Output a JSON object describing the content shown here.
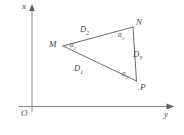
{
  "figure": {
    "type": "geometry-diagram",
    "axes": {
      "x_label": "x",
      "y_label": "y",
      "origin_label": "O",
      "x_axis_direction": "up",
      "y_axis_direction": "right",
      "origin_px": {
        "x": 32,
        "y": 107
      }
    },
    "vertices": [
      {
        "id": "M",
        "label": "M",
        "px": {
          "x": 63,
          "y": 46
        }
      },
      {
        "id": "N",
        "label": "N",
        "px": {
          "x": 133,
          "y": 27
        }
      },
      {
        "id": "P",
        "label": "P",
        "px": {
          "x": 136,
          "y": 81
        }
      }
    ],
    "sides": [
      {
        "id": "D1",
        "base": "D",
        "sub": "1",
        "from": "M",
        "to": "P",
        "label_px": {
          "x": 75,
          "y": 66
        }
      },
      {
        "id": "D2",
        "base": "D",
        "sub": "2",
        "from": "M",
        "to": "N",
        "label_px": {
          "x": 82,
          "y": 27
        }
      },
      {
        "id": "D3",
        "base": "D",
        "sub": "3",
        "from": "N",
        "to": "P",
        "label_px": {
          "x": 136,
          "y": 52
        }
      }
    ],
    "angles": [
      {
        "id": "a1",
        "base": "a",
        "sub": "1",
        "at_vertex": "M",
        "label_px": {
          "x": 72,
          "y": 42
        }
      },
      {
        "id": "a2",
        "base": "a",
        "sub": "2",
        "at_vertex": "P",
        "label_px": {
          "x": 124,
          "y": 72
        }
      },
      {
        "id": "a3",
        "base": "a",
        "sub": "3",
        "at_vertex": "N",
        "label_px": {
          "x": 120,
          "y": 32
        }
      }
    ],
    "colors": {
      "stroke": "#6b6b6b",
      "axis": "#8a8a8a",
      "text": "#4a4a4a",
      "background": "#ffffff"
    }
  }
}
